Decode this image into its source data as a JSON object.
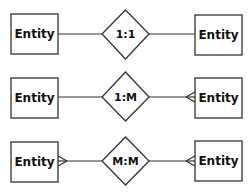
{
  "diagram": {
    "title": "",
    "rows": [
      {
        "left_entity": "Entity",
        "relationship": "1:1",
        "right_entity": "Entity",
        "left_cardinality": "one",
        "right_cardinality": "one"
      },
      {
        "left_entity": "Entity",
        "relationship": "1:M",
        "right_entity": "Entity",
        "left_cardinality": "one",
        "right_cardinality": "many"
      },
      {
        "left_entity": "Entity",
        "relationship": "M:M",
        "right_entity": "Entity",
        "left_cardinality": "many",
        "right_cardinality": "many"
      }
    ],
    "colors": {
      "stroke": "#333333",
      "fill": "#ffffff",
      "text": "#111111"
    }
  }
}
